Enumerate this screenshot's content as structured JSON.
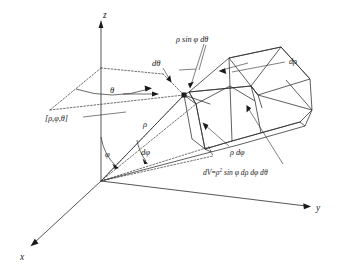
{
  "figure": {
    "background_color": "#ffffff",
    "ink_color": "#2b2b2b"
  },
  "axes": {
    "x_label": "x",
    "y_label": "y",
    "z_label": "z",
    "origin_label": ""
  },
  "angles": {
    "theta_label": "θ",
    "phi_label": "φ",
    "dtheta_label": "dθ",
    "dphi_label": "dφ"
  },
  "lengths": {
    "rho_label": "ρ",
    "drho_label": "dρ",
    "rho_dphi_label": "ρ dφ",
    "rho_sin_phi_dtheta_label": "ρ sin φ dθ"
  },
  "point": {
    "coordinate_label": "[ρ,φ,θ]"
  },
  "formula": {
    "dv_prefix": "dV",
    "dv_equals": "=",
    "dv_rho": "ρ",
    "dv_exponent": "2",
    "dv_rest": " sin φ dρ dφ dθ",
    "dv_full": "dV = ρ² sin φ dρ dφ dθ"
  }
}
